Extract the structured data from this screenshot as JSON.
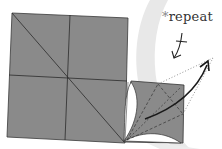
{
  "diagram": {
    "annotation": {
      "symbol": "*",
      "text": "repeat"
    },
    "colors": {
      "paper": "#8a8a8a",
      "crease": "#2b2b2b",
      "swoosh": "#e6e6e6",
      "flap": "#ffffff",
      "arrow": "#1a1a1a",
      "dotted": "#777777"
    },
    "symbols": [
      "fold-symbol",
      "curved-arrow",
      "dotted-guide"
    ]
  }
}
